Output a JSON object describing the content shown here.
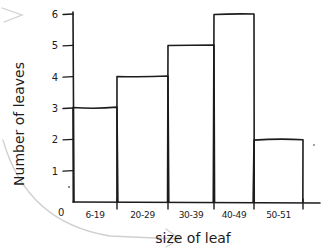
{
  "chart_data": {
    "type": "bar",
    "style": "hand-drawn histogram",
    "title": "",
    "xlabel": "size of leaf",
    "ylabel": "Number of leaves",
    "categories": [
      "6-19",
      "20-29",
      "30-39",
      "40-49",
      "50-51"
    ],
    "values": [
      3,
      4,
      5,
      6,
      2
    ],
    "y_ticks": [
      "1",
      "2",
      "3",
      "4",
      "5",
      "6"
    ],
    "origin_label": "0",
    "ylim": [
      0,
      6
    ],
    "grid": false,
    "legend": "none",
    "colors": {
      "ink": "#1c1c1c",
      "annotation_arrows": "#cfcfcf",
      "background": "#ffffff"
    }
  }
}
